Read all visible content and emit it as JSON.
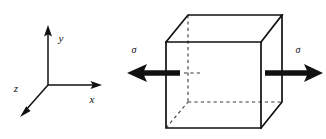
{
  "figure": {
    "background_color": "#ffffff",
    "line_color": "#111111",
    "hidden_line_color": "#3a3a3a",
    "width": 326,
    "height": 139
  },
  "axes": {
    "name": "coordinate-axes",
    "origin": {
      "x": 48,
      "y": 85
    },
    "labels": {
      "x": "x",
      "y": "y",
      "z": "z"
    },
    "endpoints": {
      "x": {
        "x": 101,
        "y": 85
      },
      "y": {
        "x": 48,
        "y": 27
      },
      "z": {
        "x": 21,
        "y": 116
      }
    },
    "label_positions": {
      "x": {
        "x": 92,
        "y": 103
      },
      "y": {
        "x": 60,
        "y": 41
      },
      "z": {
        "x": 15,
        "y": 91
      }
    }
  },
  "cube": {
    "name": "stress-element-cube",
    "front_face": {
      "top_left": {
        "x": 166,
        "y": 42
      },
      "top_right": {
        "x": 261,
        "y": 42
      },
      "bottom_right": {
        "x": 261,
        "y": 128
      },
      "bottom_left": {
        "x": 166,
        "y": 128
      }
    },
    "back_face": {
      "top_left": {
        "x": 188,
        "y": 15
      },
      "top_right": {
        "x": 282,
        "y": 15
      },
      "bottom_right": {
        "x": 282,
        "y": 102
      },
      "bottom_left": {
        "x": 188,
        "y": 102
      }
    },
    "hidden_edges": [
      "back-left-vertical",
      "back-bottom-horizontal",
      "bottom-left-diagonal"
    ]
  },
  "stress_arrows": [
    {
      "name": "stress-arrow-left",
      "label": "σ",
      "direction": "left",
      "tip": {
        "x": 128,
        "y": 73
      },
      "tail": {
        "x": 180,
        "y": 73
      },
      "label_position": {
        "x": 133,
        "y": 52
      }
    },
    {
      "name": "stress-arrow-right",
      "label": "σ",
      "direction": "right",
      "tip": {
        "x": 322,
        "y": 73
      },
      "tail": {
        "x": 265,
        "y": 73
      },
      "label_position": {
        "x": 297,
        "y": 52
      }
    }
  ],
  "interior_marker": {
    "name": "interior-dashed-segment",
    "from": {
      "x": 184,
      "y": 73
    },
    "to": {
      "x": 200,
      "y": 73
    }
  }
}
